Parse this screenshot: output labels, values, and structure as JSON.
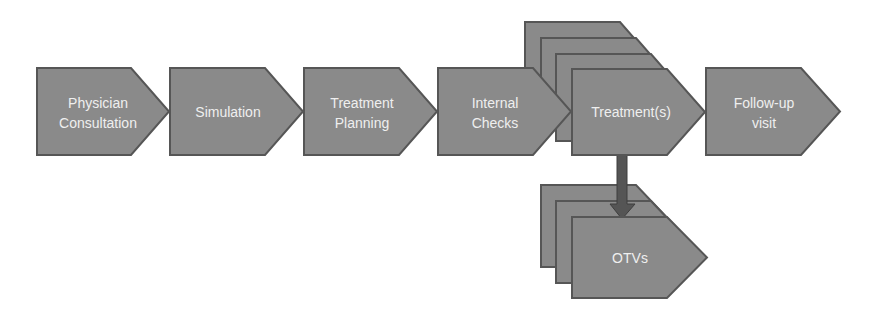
{
  "diagram": {
    "colors": {
      "shape_fill": "#8a8a8a",
      "shape_border": "#565656",
      "arrow": "#555555",
      "text": "#efefef",
      "background": "#ffffff"
    },
    "steps": [
      {
        "id": "physician-consultation",
        "lines": [
          "Physician",
          "Consultation"
        ]
      },
      {
        "id": "simulation",
        "lines": [
          "Simulation"
        ]
      },
      {
        "id": "treatment-planning",
        "lines": [
          "Treatment",
          "Planning"
        ]
      },
      {
        "id": "internal-checks",
        "lines": [
          "Internal",
          "Checks"
        ]
      },
      {
        "id": "treatments",
        "lines": [
          "Treatment(s)"
        ],
        "stacked_copies": 4
      },
      {
        "id": "follow-up-visit",
        "lines": [
          "Follow-up",
          "visit"
        ]
      }
    ],
    "branch": {
      "from": "treatments",
      "to": "otvs",
      "arrow_direction": "down",
      "node": {
        "id": "otvs",
        "lines": [
          "OTVs"
        ],
        "stacked_copies": 3
      }
    }
  }
}
